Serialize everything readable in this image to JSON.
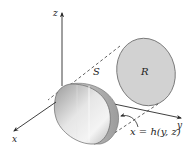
{
  "figure": {
    "type": "3d-surface-projection-diagram",
    "axes": {
      "x_label": "x",
      "y_label": "y",
      "z_label": "z"
    },
    "regions": {
      "surface_label": "S",
      "projection_label": "R"
    },
    "equation": "x = h(y, z)",
    "colors": {
      "region_fill": "#d2d2d2",
      "region_stroke": "#6a6a6a",
      "solid_light": "#f0f0f0",
      "solid_dark": "#8e8e8e",
      "axis_stroke": "#2a2a2a",
      "dash_stroke": "#3a3a3a"
    }
  }
}
